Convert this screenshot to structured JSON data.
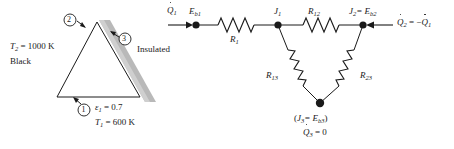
{
  "figure": {
    "background_color": "#ffffff",
    "line_color": "#1a1a1a",
    "insulation_color": "#b9b9b9"
  },
  "enclosure": {
    "name": "triangular-enclosure",
    "surface_markers": [
      {
        "id": "1",
        "label": "1"
      },
      {
        "id": "2",
        "label": "2"
      },
      {
        "id": "3",
        "label": "3"
      }
    ],
    "surface2_temperature": "T",
    "surface2_temperature_sub": "2",
    "surface2_temperature_value": "= 1000 K",
    "surface2_property": "Black",
    "surface3_label": "Insulated",
    "surface1_emissivity_symbol": "ε",
    "surface1_emissivity_sub": "1",
    "surface1_emissivity_value": "= 0.7",
    "surface1_temperature": "T",
    "surface1_temperature_sub": "1",
    "surface1_temperature_value": "= 600 K"
  },
  "network": {
    "name": "radiation-resistance-network",
    "nodes": [
      {
        "id": "Eb1",
        "symbol": "E",
        "sub": "b1",
        "x": 196,
        "y": 25
      },
      {
        "id": "J1",
        "symbol": "J",
        "sub": "1",
        "x": 278,
        "y": 25
      },
      {
        "id": "J2",
        "symbol": "J",
        "sub": "2",
        "x": 363,
        "y": 25,
        "equals": "= E",
        "equals_sub": "b2"
      },
      {
        "id": "J3",
        "symbol": "J",
        "sub": "3",
        "x": 320,
        "y": 103
      }
    ],
    "resistors": [
      {
        "id": "R1",
        "symbol": "R",
        "sub": "1"
      },
      {
        "id": "R12",
        "symbol": "R",
        "sub": "12"
      },
      {
        "id": "R13",
        "symbol": "R",
        "sub": "13"
      },
      {
        "id": "R23",
        "symbol": "R",
        "sub": "23"
      }
    ],
    "heat_flow_in": {
      "symbol": "Q",
      "sub": "1",
      "direction": "right"
    },
    "heat_flow_out": {
      "symbol": "Q",
      "sub": "2",
      "relation": "= −",
      "relation_symbol": "Q",
      "relation_sub": "1",
      "direction": "left"
    },
    "bottom_node_label_open": "(",
    "bottom_node_label_j": "J",
    "bottom_node_label_j_sub": "3",
    "bottom_node_label_eq": "= E",
    "bottom_node_label_eb": "b3",
    "bottom_node_label_close": ")",
    "bottom_flux_symbol": "Q",
    "bottom_flux_sub": "3",
    "bottom_flux_value": "= 0"
  }
}
